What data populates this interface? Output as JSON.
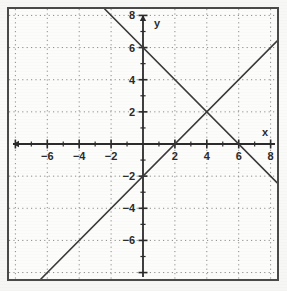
{
  "figure": {
    "title": "",
    "frame_border_color": "#4a4a4a",
    "background_color": "#fcfcfb",
    "grid_color": "#8d8d8d",
    "axis_color": "#2b2b2b",
    "line_color": "#3a3a3a"
  },
  "axis": {
    "x_axis_label": "x",
    "y_axis_label": "y",
    "x_ticks": [
      {
        "value": -6,
        "label": "−6"
      },
      {
        "value": -4,
        "label": "−4"
      },
      {
        "value": -2,
        "label": "−2"
      },
      {
        "value": 2,
        "label": "2"
      },
      {
        "value": 4,
        "label": "4"
      },
      {
        "value": 6,
        "label": "6"
      },
      {
        "value": 8,
        "label": "8"
      }
    ],
    "y_ticks": [
      {
        "value": 8,
        "label": "8"
      },
      {
        "value": 6,
        "label": "6"
      },
      {
        "value": 4,
        "label": "4"
      },
      {
        "value": 2,
        "label": "2"
      },
      {
        "value": -2,
        "label": "−2"
      },
      {
        "value": -4,
        "label": "−4"
      },
      {
        "value": -6,
        "label": "−6"
      }
    ]
  },
  "chart_data": {
    "type": "line",
    "title": "",
    "xlabel": "x",
    "ylabel": "y",
    "xlim": [
      -8.4,
      8.4
    ],
    "ylim": [
      -8.4,
      8.4
    ],
    "grid": true,
    "grid_step": 2,
    "minor_tick_step": 1,
    "legend": "none",
    "series": [
      {
        "name": "descending-line",
        "equation": "y = -x + 6",
        "slope": -1,
        "intercept": 6,
        "x": [
          -2.4,
          8.4
        ],
        "y": [
          8.4,
          -2.4
        ],
        "x_intercept": 6,
        "y_intercept": 6
      },
      {
        "name": "ascending-line",
        "equation": "y = x - 2",
        "slope": 1,
        "intercept": -2,
        "x": [
          -6.4,
          8.4
        ],
        "y": [
          -8.4,
          6.4
        ],
        "x_intercept": 2,
        "y_intercept": -2
      }
    ],
    "annotations": [
      {
        "name": "intersection",
        "x": 4,
        "y": 2,
        "label": ""
      }
    ]
  }
}
